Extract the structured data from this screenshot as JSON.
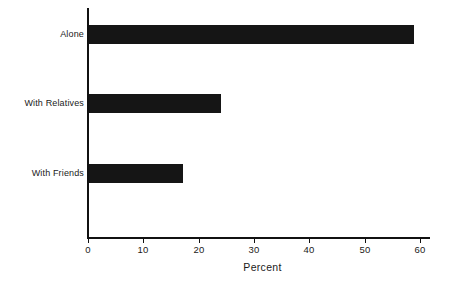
{
  "chart_data": {
    "type": "bar",
    "orientation": "horizontal",
    "title": "",
    "subtitle": "",
    "categories": [
      "Alone",
      "With Relatives",
      "With Friends"
    ],
    "values": [
      59,
      24,
      17
    ],
    "xlabel": "Percent",
    "ylabel": "",
    "xlim": [
      0,
      60
    ],
    "xticks": [
      0,
      10,
      20,
      30,
      40,
      50,
      60
    ],
    "xtick_labels": [
      "0",
      "10",
      "20",
      "30",
      "40",
      "50",
      "60"
    ],
    "grid": false,
    "legend": null,
    "series": [
      {
        "name": "Percent",
        "values": [
          59,
          24,
          17
        ],
        "color": "#151515"
      }
    ],
    "annotations": []
  },
  "colors": {
    "bar": "#151515",
    "axis": "#111111",
    "text": "#1a1a1a",
    "background": "#ffffff"
  }
}
